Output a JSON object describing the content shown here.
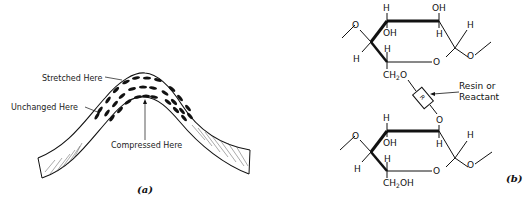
{
  "panel_a": {
    "caption": "(a)",
    "labels": {
      "stretched": "Stretched Here",
      "unchanged": "Unchanged Here",
      "compressed": "Compressed Here"
    }
  },
  "panel_b": {
    "caption": "(b)",
    "top_ring": {
      "h_top_left": "H",
      "oh_top_right": "OH",
      "oh_inner": "OH",
      "h_inner_right": "H",
      "h_right": "H",
      "h_left": "H",
      "h_lower_inner": "H",
      "ring_o": "O",
      "left_o": "O",
      "right_o": "O",
      "ch2o": "CH",
      "ch2o_sub": "2",
      "ch2o_tail": "O"
    },
    "linker": {
      "symbol": "R",
      "label_line1": "Resin or",
      "label_line2": "Reactant"
    },
    "bottom_ring": {
      "top_o": "O",
      "h_top_left": "H",
      "oh_inner": "OH",
      "h_inner_right": "H",
      "h_right": "H",
      "h_left": "H",
      "h_lower_inner": "H",
      "ring_o": "O",
      "left_o": "O",
      "right_o": "O",
      "ch2oh": "CH",
      "ch2oh_sub": "2",
      "ch2oh_tail": "OH"
    }
  }
}
